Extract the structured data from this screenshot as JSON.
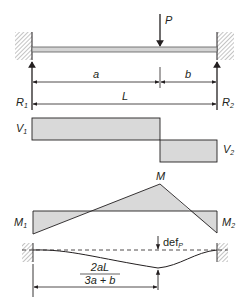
{
  "diagram": {
    "colors": {
      "line": "#231f20",
      "fill": "#d9d9d9",
      "beam_fill": "#d4d4d4",
      "hatch": "#8a8a8a"
    },
    "load": {
      "label": "P"
    },
    "reactions": {
      "left": {
        "label": "R",
        "sub": "1"
      },
      "right": {
        "label": "R",
        "sub": "2"
      }
    },
    "dimensions": {
      "a": "a",
      "b": "b",
      "L": "L",
      "deflection_location_numerator": "2aL",
      "deflection_location_denominator": "3a + b"
    },
    "shear": {
      "left": {
        "label": "V",
        "sub": "1"
      },
      "right": {
        "label": "V",
        "sub": "2"
      }
    },
    "moment": {
      "peak": "M",
      "left": {
        "label": "M",
        "sub": "1"
      },
      "right": {
        "label": "M",
        "sub": "2"
      }
    },
    "deflection": {
      "label": "def",
      "sub": "P"
    }
  }
}
